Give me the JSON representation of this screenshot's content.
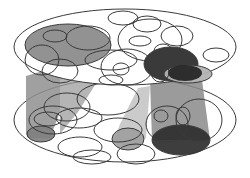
{
  "diagram": {
    "width": 250,
    "height": 178,
    "colors": {
      "background": "#ffffff",
      "stroke": "#3a3a3a",
      "gray": "#8c8c8c",
      "dark": "#2f2f2f",
      "light": "#b8b8b8",
      "cylinder_gray": "#9a9a9a",
      "cylinder_light": "#c4c4c4",
      "cylinder_dark": "#7a7a7a"
    },
    "cylinders": [
      {
        "name": "left-cylinder",
        "points": "26,76 60,66 60,112 50,138 28,138 26,134",
        "fill": "#8f8f8f",
        "opacity": 0.85
      },
      {
        "name": "left-cylinder-upper",
        "points": "60,66 112,58 78,112 60,134 60,112",
        "fill": "#9c9c9c",
        "opacity": 0.75
      },
      {
        "name": "middle-cylinder",
        "points": "138,88 150,86 146,138 128,148 114,140 120,124",
        "fill": "#c2c2c2",
        "opacity": 0.85
      },
      {
        "name": "right-cylinder",
        "points": "150,80 202,80 210,140 152,140",
        "fill": "#8a8a8a",
        "opacity": 0.85
      }
    ],
    "bottom_disc": {
      "cx": 125,
      "cy": 120,
      "rx": 111,
      "ry": 42
    },
    "top_disc": {
      "cx": 125,
      "cy": 47,
      "rx": 111,
      "ry": 38
    },
    "bottom_shaded": [
      {
        "name": "bottom-gray-left",
        "cx": 41,
        "cy": 134,
        "rx": 14,
        "ry": 8,
        "fill": "#7f7f7f"
      },
      {
        "name": "bottom-gray-middle",
        "cx": 128,
        "cy": 139,
        "rx": 16,
        "ry": 11,
        "fill": "#a0a0a0"
      },
      {
        "name": "bottom-dark-right",
        "cx": 181,
        "cy": 140,
        "rx": 29,
        "ry": 15,
        "fill": "#2e2e2e"
      }
    ],
    "bottom_outlines": [
      {
        "cx": 67,
        "cy": 107,
        "rx": 23,
        "ry": 14
      },
      {
        "cx": 79,
        "cy": 118,
        "rx": 23,
        "ry": 10
      },
      {
        "cx": 53,
        "cy": 120,
        "rx": 24,
        "ry": 14
      },
      {
        "cx": 108,
        "cy": 99,
        "rx": 31,
        "ry": 16
      },
      {
        "cx": 118,
        "cy": 130,
        "rx": 24,
        "ry": 12
      },
      {
        "cx": 80,
        "cy": 147,
        "rx": 22,
        "ry": 10
      },
      {
        "cx": 92,
        "cy": 157,
        "rx": 19,
        "ry": 7
      },
      {
        "cx": 136,
        "cy": 154,
        "rx": 19,
        "ry": 10
      },
      {
        "cx": 161,
        "cy": 116,
        "rx": 7,
        "ry": 6
      },
      {
        "cx": 183,
        "cy": 116,
        "rx": 7,
        "ry": 9
      },
      {
        "cx": 199,
        "cy": 120,
        "rx": 23,
        "ry": 21
      },
      {
        "cx": 167,
        "cy": 124,
        "rx": 21,
        "ry": 18
      },
      {
        "cx": 48,
        "cy": 119,
        "rx": 14,
        "ry": 7
      }
    ],
    "top_shaded": [
      {
        "name": "top-gray-left",
        "cx": 68,
        "cy": 45,
        "rx": 43,
        "ry": 21,
        "fill": "#8c8c8c"
      },
      {
        "name": "top-dark-right",
        "cx": 171,
        "cy": 64,
        "rx": 27,
        "ry": 17,
        "fill": "#2f2f2f"
      },
      {
        "name": "top-light-right",
        "cx": 188,
        "cy": 74,
        "rx": 24,
        "ry": 9,
        "fill": "#b2b2b2"
      }
    ],
    "top_inner_overlap": {
      "cx": 185,
      "cy": 73,
      "rx": 17,
      "ry": 8,
      "fill": "#1f1f1f"
    },
    "top_outlines": [
      {
        "cx": 55,
        "cy": 36,
        "rx": 12,
        "ry": 6
      },
      {
        "cx": 88,
        "cy": 38,
        "rx": 22,
        "ry": 12
      },
      {
        "cx": 42,
        "cy": 60,
        "rx": 17,
        "ry": 15
      },
      {
        "cx": 60,
        "cy": 71,
        "rx": 18,
        "ry": 12
      },
      {
        "cx": 123,
        "cy": 18,
        "rx": 15,
        "ry": 7
      },
      {
        "cx": 147,
        "cy": 24,
        "rx": 14,
        "ry": 8
      },
      {
        "cx": 150,
        "cy": 40,
        "rx": 32,
        "ry": 21
      },
      {
        "cx": 140,
        "cy": 41,
        "rx": 11,
        "ry": 5
      },
      {
        "cx": 177,
        "cy": 36,
        "rx": 16,
        "ry": 10
      },
      {
        "cx": 163,
        "cy": 51,
        "rx": 9,
        "ry": 7
      },
      {
        "cx": 216,
        "cy": 55,
        "rx": 13,
        "ry": 7
      },
      {
        "cx": 127,
        "cy": 67,
        "rx": 26,
        "ry": 18
      },
      {
        "cx": 121,
        "cy": 69,
        "rx": 8,
        "ry": 6
      },
      {
        "cx": 111,
        "cy": 80,
        "rx": 12,
        "ry": 5
      },
      {
        "cx": 111,
        "cy": 60,
        "rx": 26,
        "ry": 10
      },
      {
        "cx": 160,
        "cy": 72,
        "rx": 9,
        "ry": 10
      }
    ]
  }
}
